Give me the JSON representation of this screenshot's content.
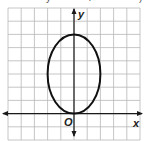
{
  "chart_data": {
    "type": "line",
    "title": "",
    "xlabel": "x",
    "ylabel": "y",
    "origin_label": "O",
    "grid": true,
    "xlim": [
      -5,
      5
    ],
    "ylim": [
      -2,
      8
    ],
    "grid_step": 1,
    "tick_labels": [],
    "series": [
      {
        "name": "ellipse",
        "shape": "ellipse",
        "center": [
          0,
          3
        ],
        "semi_axis_x": 2,
        "semi_axis_y": 3,
        "equation": "x^2/4 + (y-3)^2/9 = 1",
        "key_points": [
          [
            0,
            0
          ],
          [
            0,
            6
          ],
          [
            -2,
            3
          ],
          [
            2,
            3
          ]
        ]
      }
    ],
    "legend": null
  },
  "labels": {
    "x_axis": "x",
    "y_axis": "y",
    "origin": "O",
    "clipped_top": [
      "y",
      "4",
      ")"
    ]
  },
  "colors": {
    "grid": "#b8b8b8",
    "axis": "#1a1a1a",
    "curve": "#111111",
    "background": "#ffffff"
  }
}
